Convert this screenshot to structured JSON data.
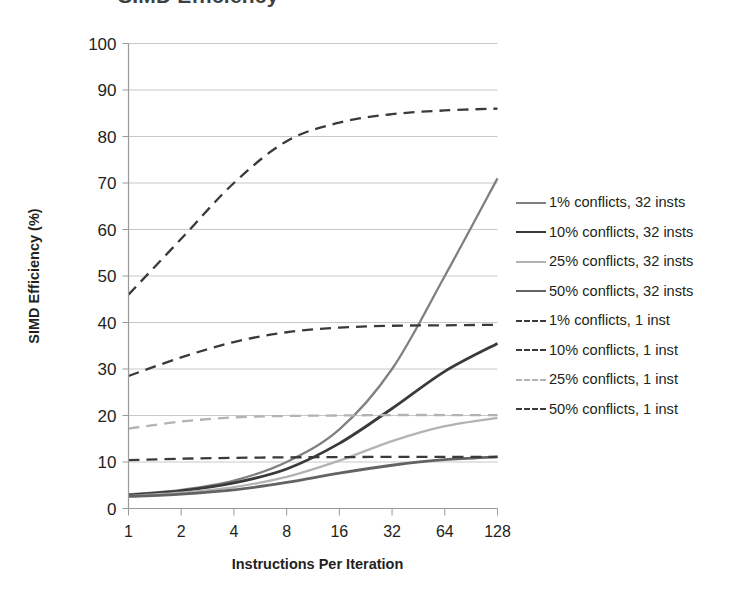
{
  "title": "SIMD Efficiency",
  "axes": {
    "y_title": "SIMD Efficiency (%)",
    "x_title": "Instructions Per Iteration",
    "y_ticks": [
      "0",
      "10",
      "20",
      "30",
      "40",
      "50",
      "60",
      "70",
      "80",
      "90",
      "100"
    ],
    "x_ticks": [
      "1",
      "2",
      "4",
      "8",
      "16",
      "32",
      "64",
      "128"
    ]
  },
  "colors": {
    "series_1pct_32": "#808080",
    "series_10pct_32": "#3a3a3a",
    "series_25pct_32": "#b3b3b3",
    "series_50pct_32": "#636363",
    "series_1pct_1": "#3a3a3a",
    "series_10pct_1": "#3a3a3a",
    "series_25pct_1": "#b3b3b3",
    "series_50pct_1": "#3a3a3a",
    "gridline": "#c8c8c8",
    "axis": "#9a9a9a",
    "text": "#231f20"
  },
  "legend": {
    "items": [
      {
        "label": "1% conflicts, 32 insts",
        "color": "#808080",
        "style": "solid",
        "width": 2.3
      },
      {
        "label": "10% conflicts, 32 insts",
        "color": "#3a3a3a",
        "style": "solid",
        "width": 2.8
      },
      {
        "label": "25% conflicts, 32 insts",
        "color": "#b3b3b3",
        "style": "solid",
        "width": 2.3
      },
      {
        "label": "50% conflicts, 32 insts",
        "color": "#636363",
        "style": "solid",
        "width": 2.8
      },
      {
        "label": "1% conflicts, 1 inst",
        "color": "#3a3a3a",
        "style": "dashed",
        "width": 2.3
      },
      {
        "label": "10% conflicts, 1 inst",
        "color": "#3a3a3a",
        "style": "dashed",
        "width": 2.3
      },
      {
        "label": "25% conflicts, 1 inst",
        "color": "#b3b3b3",
        "style": "dashed",
        "width": 2.3
      },
      {
        "label": "50% conflicts, 1 inst",
        "color": "#3a3a3a",
        "style": "dashed",
        "width": 2.3
      }
    ]
  },
  "chart_data": {
    "type": "line",
    "title": "SIMD Efficiency",
    "xlabel": "Instructions Per Iteration",
    "ylabel": "SIMD Efficiency (%)",
    "x": [
      1,
      2,
      4,
      8,
      16,
      32,
      64,
      128
    ],
    "x_scale": "log2",
    "xticklabels": [
      "1",
      "2",
      "4",
      "8",
      "16",
      "32",
      "64",
      "128"
    ],
    "ylim": [
      0,
      100
    ],
    "yticks": [
      0,
      10,
      20,
      30,
      40,
      50,
      60,
      70,
      80,
      90,
      100
    ],
    "grid": true,
    "legend_position": "right",
    "series": [
      {
        "name": "1% conflicts, 32 insts",
        "style": "solid",
        "color": "#808080",
        "values": [
          3.0,
          4.0,
          6.0,
          10.0,
          17.0,
          30.0,
          50.0,
          71.0
        ]
      },
      {
        "name": "10% conflicts, 32 insts",
        "style": "solid",
        "color": "#3a3a3a",
        "values": [
          2.9,
          3.8,
          5.5,
          8.5,
          14.0,
          21.5,
          29.5,
          35.5
        ]
      },
      {
        "name": "25% conflicts, 32 insts",
        "style": "solid",
        "color": "#b3b3b3",
        "values": [
          2.7,
          3.4,
          4.6,
          6.8,
          10.3,
          14.5,
          17.7,
          19.5
        ]
      },
      {
        "name": "50% conflicts, 32 insts",
        "style": "solid",
        "color": "#636363",
        "values": [
          2.6,
          3.1,
          4.0,
          5.6,
          7.6,
          9.3,
          10.5,
          11.1
        ]
      },
      {
        "name": "1% conflicts, 1 inst",
        "style": "dashed",
        "color": "#3a3a3a",
        "values": [
          46.0,
          58.0,
          70.0,
          79.0,
          83.0,
          84.8,
          85.6,
          86.0
        ]
      },
      {
        "name": "10% conflicts, 1 inst",
        "style": "dashed",
        "color": "#3a3a3a",
        "values": [
          28.5,
          32.5,
          35.8,
          37.9,
          38.9,
          39.3,
          39.4,
          39.5
        ]
      },
      {
        "name": "25% conflicts, 1 inst",
        "style": "dashed",
        "color": "#b3b3b3",
        "values": [
          17.2,
          18.7,
          19.6,
          19.9,
          20.0,
          20.1,
          20.1,
          20.1
        ]
      },
      {
        "name": "50% conflicts, 1 inst",
        "style": "dashed",
        "color": "#3a3a3a",
        "values": [
          10.4,
          10.7,
          10.9,
          11.0,
          11.05,
          11.1,
          11.1,
          11.1
        ]
      }
    ]
  }
}
